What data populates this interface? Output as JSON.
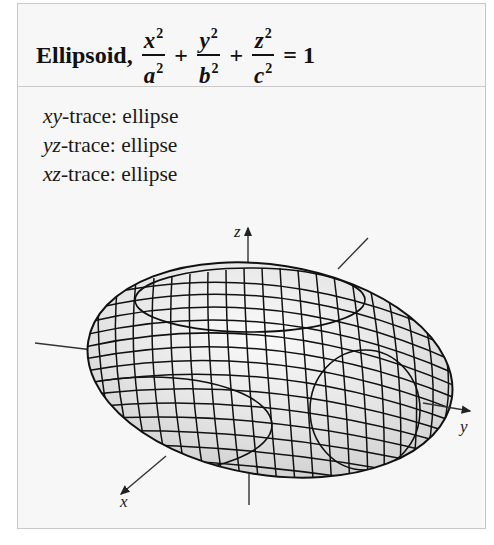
{
  "header": {
    "title_word": "Ellipsoid,",
    "equation": {
      "terms": [
        {
          "num": "x",
          "den": "a",
          "exp": "2"
        },
        {
          "num": "y",
          "den": "b",
          "exp": "2"
        },
        {
          "num": "z",
          "den": "c",
          "exp": "2"
        }
      ],
      "plus": "+",
      "equals": "=",
      "rhs": "1"
    }
  },
  "traces": [
    {
      "var": "xy",
      "suffix": "-trace: ellipse"
    },
    {
      "var": "yz",
      "suffix": "-trace: ellipse"
    },
    {
      "var": "xz",
      "suffix": "-trace: ellipse"
    }
  ],
  "figure": {
    "axes": {
      "x_label": "x",
      "y_label": "y",
      "z_label": "z"
    },
    "surface": "ellipsoid wireframe",
    "colors": {
      "surface_fill": "#e9e9e9",
      "grid_line": "#111111",
      "axis_line": "#333333",
      "frame_border": "#c9c9c9",
      "panel_bg": "#f7f7f7"
    }
  }
}
